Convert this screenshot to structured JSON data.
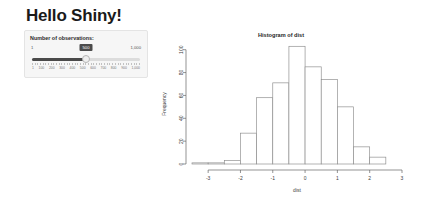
{
  "app": {
    "title": "Hello Shiny!"
  },
  "sidebar": {
    "slider": {
      "label": "Number of observations:",
      "min_label": "1",
      "max_label": "1,000",
      "value_label": "500",
      "value": 500,
      "min": 1,
      "max": 1000,
      "scale_labels": [
        "1",
        "100",
        "200",
        "300",
        "400",
        "500",
        "600",
        "700",
        "800",
        "900",
        "1,000"
      ]
    }
  },
  "chart_data": {
    "type": "bar",
    "title": "Histogram of dist",
    "xlabel": "dist",
    "ylabel": "Frequency",
    "xlim": [
      -3.5,
      3.0
    ],
    "ylim": [
      0,
      105
    ],
    "grid": false,
    "legend": null,
    "bin_width": 0.5,
    "bin_starts": [
      -3.5,
      -3.0,
      -2.5,
      -2.0,
      -1.5,
      -1.0,
      -0.5,
      0.0,
      0.5,
      1.0,
      1.5,
      2.0,
      2.5
    ],
    "values": [
      1,
      1,
      3,
      27,
      58,
      71,
      103,
      85,
      74,
      50,
      15,
      6,
      0
    ],
    "xticks": [
      -3,
      -2,
      -1,
      0,
      1,
      2,
      3
    ],
    "xtick_labels": [
      "-3",
      "-2",
      "-1",
      "0",
      "1",
      "2",
      "3"
    ],
    "yticks": [
      0,
      20,
      40,
      60,
      80,
      100
    ],
    "ytick_labels": [
      "0",
      "20",
      "40",
      "60",
      "80",
      "100"
    ]
  }
}
